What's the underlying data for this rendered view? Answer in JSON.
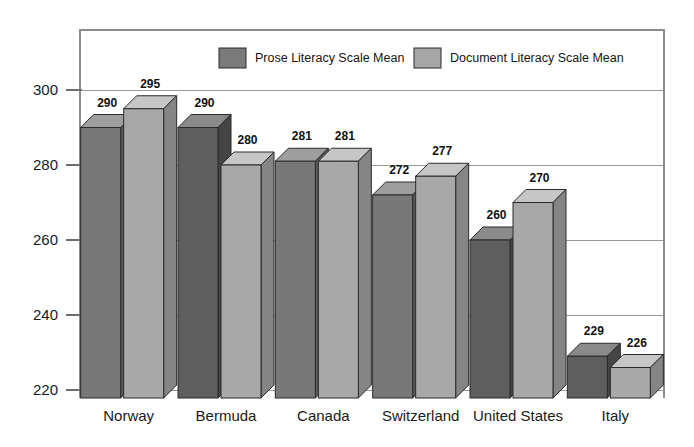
{
  "chart_data": {
    "type": "bar",
    "title": "",
    "subtitle": "",
    "xlabel": "",
    "ylabel": "",
    "categories": [
      "Norway",
      "Bermuda",
      "Canada",
      "Switzerland",
      "United States",
      "Italy"
    ],
    "series": [
      {
        "name": "Prose Literacy Scale Mean",
        "color": "#7b7b7b",
        "values": [
          290,
          290,
          281,
          272,
          260,
          229
        ]
      },
      {
        "name": "Document Literacy Scale Mean",
        "color": "#a6a6a6",
        "values": [
          295,
          280,
          281,
          277,
          270,
          226
        ]
      }
    ],
    "ylim": [
      220,
      300
    ],
    "yticks": [
      220,
      240,
      260,
      280,
      300
    ],
    "ytick_labels": [
      "220",
      "240",
      "260",
      "280",
      "300"
    ],
    "grid": true,
    "grid_axis": "y",
    "legend_position": "top-center",
    "bar_style": "3d-box",
    "data_labels": true
  },
  "legend": {
    "entries": [
      {
        "label": "Prose Literacy Scale Mean",
        "color": "#7b7b7b"
      },
      {
        "label": "Document Literacy Scale Mean",
        "color": "#a6a6a6"
      }
    ]
  },
  "colors": {
    "prose_front": "#787878",
    "prose_top": "#9e9e9e",
    "prose_side": "#5a5a5a",
    "document_front": "#a8a8a8",
    "document_top": "#c6c6c6",
    "document_side": "#858585",
    "prose_dark_front": "#5e5e5e",
    "prose_dark_top": "#8a8a8a",
    "prose_dark_side": "#454545",
    "grid": "#9a9a9a",
    "frame": "#8c8c8c",
    "text": "#1a1a1a",
    "background": "#ffffff"
  }
}
